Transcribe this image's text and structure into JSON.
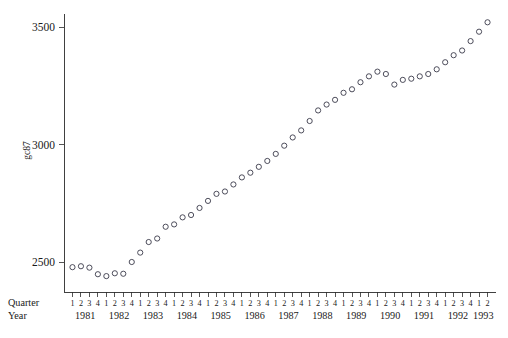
{
  "figure": {
    "background": "#ffffff",
    "marker_color": "#3a3a4a",
    "axis_color": "#2b2b2b"
  },
  "axis_row_labels": {
    "quarter": "Quarter",
    "year": "Year"
  },
  "chart_data": {
    "type": "scatter",
    "title": "",
    "subtitle": "",
    "xlabel": "Quarter / Year",
    "ylabel": "gc87",
    "grid": false,
    "legend": "none",
    "ylim": [
      2400,
      3560
    ],
    "yticks": [
      2500,
      3000,
      3500
    ],
    "ytick_labels": [
      "2500",
      "3000",
      "3500"
    ],
    "xtick_labels_quarter": [
      "1",
      "2",
      "3",
      "4",
      "1",
      "2",
      "3",
      "4",
      "1",
      "2",
      "3",
      "4",
      "1",
      "2",
      "3",
      "4",
      "1",
      "2",
      "3",
      "4",
      "1",
      "2",
      "3",
      "4",
      "1",
      "2",
      "3",
      "4",
      "1",
      "2",
      "3",
      "4",
      "1",
      "2",
      "3",
      "4",
      "1",
      "2",
      "3",
      "4",
      "1",
      "2",
      "3",
      "4",
      "1",
      "2",
      "3",
      "4",
      "1",
      "2"
    ],
    "xtick_labels_year": [
      "1981",
      "1982",
      "1983",
      "1984",
      "1985",
      "1986",
      "1987",
      "1988",
      "1989",
      "1990",
      "1991",
      "1992",
      "1993"
    ],
    "year_quarter_counts": [
      4,
      4,
      4,
      4,
      4,
      4,
      4,
      4,
      4,
      4,
      4,
      4,
      2
    ],
    "x": [
      "1981 Q1",
      "1981 Q2",
      "1981 Q3",
      "1981 Q4",
      "1982 Q1",
      "1982 Q2",
      "1982 Q3",
      "1982 Q4",
      "1983 Q1",
      "1983 Q2",
      "1983 Q3",
      "1983 Q4",
      "1984 Q1",
      "1984 Q2",
      "1984 Q3",
      "1984 Q4",
      "1985 Q1",
      "1985 Q2",
      "1985 Q3",
      "1985 Q4",
      "1986 Q1",
      "1986 Q2",
      "1986 Q3",
      "1986 Q4",
      "1987 Q1",
      "1987 Q2",
      "1987 Q3",
      "1987 Q4",
      "1988 Q1",
      "1988 Q2",
      "1988 Q3",
      "1988 Q4",
      "1989 Q1",
      "1989 Q2",
      "1989 Q3",
      "1989 Q4",
      "1990 Q1",
      "1990 Q2",
      "1990 Q3",
      "1990 Q4",
      "1991 Q1",
      "1991 Q2",
      "1991 Q3",
      "1991 Q4",
      "1992 Q1",
      "1992 Q2",
      "1992 Q3",
      "1992 Q4",
      "1993 Q1",
      "1993 Q2"
    ],
    "values": [
      2478,
      2482,
      2476,
      2448,
      2440,
      2452,
      2450,
      2500,
      2540,
      2585,
      2600,
      2650,
      2660,
      2690,
      2700,
      2730,
      2760,
      2790,
      2800,
      2830,
      2860,
      2880,
      2905,
      2930,
      2960,
      2995,
      3030,
      3060,
      3100,
      3145,
      3170,
      3190,
      3220,
      3235,
      3265,
      3290,
      3310,
      3300,
      3255,
      3275,
      3280,
      3290,
      3300,
      3320,
      3350,
      3380,
      3400,
      3440,
      3480,
      3520
    ]
  }
}
